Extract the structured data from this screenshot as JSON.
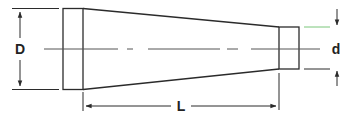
{
  "diagram": {
    "type": "technical-drawing",
    "labels": {
      "large_diameter": "D",
      "small_diameter": "d",
      "length": "L"
    },
    "colors": {
      "line": "#2b2b2b",
      "centerline": "#555555",
      "accent_line": "#7bc67b",
      "background": "#ffffff"
    }
  }
}
